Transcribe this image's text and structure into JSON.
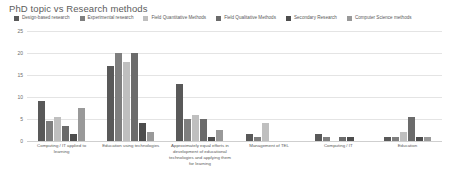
{
  "chart_data": {
    "type": "bar",
    "title": "PhD topic vs Research methods",
    "xlabel": "",
    "ylabel": "",
    "ylim": [
      0,
      25
    ],
    "yticks": [
      25,
      20,
      15,
      10,
      5,
      0
    ],
    "grid": true,
    "legend_position": "top",
    "categories": [
      "Computing / IT applied to learning",
      "Education using technologies",
      "Approximately equal efforts in development of educational technologies and applying them for learning",
      "Management of TEL",
      "Computing / IT",
      "Education"
    ],
    "series": [
      {
        "name": "Design-based research",
        "color": "#595959",
        "values": [
          9,
          17,
          13,
          1.5,
          1.5,
          1
        ]
      },
      {
        "name": "Experimental research",
        "color": "#7f7f7f",
        "values": [
          4.5,
          20,
          5,
          1,
          1,
          1
        ]
      },
      {
        "name": "Field Quantitative Methods",
        "color": "#bfbfbf",
        "values": [
          5.5,
          18,
          6,
          4,
          0,
          2
        ]
      },
      {
        "name": "Field Qualitative Methods",
        "color": "#6b6b6b",
        "values": [
          3.5,
          20,
          5,
          0,
          1,
          5.5
        ]
      },
      {
        "name": "Secondary Research",
        "color": "#4d4d4d",
        "values": [
          1.5,
          4,
          1,
          0,
          1,
          1
        ]
      },
      {
        "name": "Computer Science methods",
        "color": "#999999",
        "values": [
          7.5,
          2,
          2.5,
          0,
          0,
          1
        ]
      }
    ]
  },
  "colors": {
    "background": "#ffffff",
    "grid": "#e4e4e4",
    "axis": "#cfcfcf",
    "text": "#5a5a5a"
  }
}
